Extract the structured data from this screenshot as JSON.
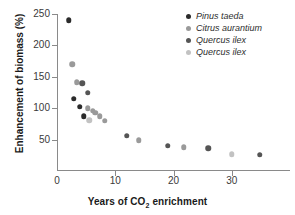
{
  "chart_data": {
    "type": "scatter",
    "title": "",
    "xlabel": "Years of CO2 enrichment",
    "xlabel_prefix": "Years of CO",
    "xlabel_sub": "2",
    "xlabel_suffix": " enrichment",
    "ylabel": "Enhancement of biomass (%)",
    "xlim": [
      0,
      40
    ],
    "ylim": [
      0,
      250
    ],
    "xticks": [
      0,
      10,
      20,
      30
    ],
    "yticks": [
      50,
      100,
      150,
      200,
      250
    ],
    "xtick_labels": [
      "0",
      "10",
      "20",
      "30"
    ],
    "ytick_labels": [
      "50",
      "100",
      "150",
      "200",
      "250"
    ],
    "grid": false,
    "legend_position": "top-right",
    "series": [
      {
        "name": "Pinus taeda",
        "color": "#2b2b2b",
        "points": [
          {
            "x": 2.0,
            "y": 240
          },
          {
            "x": 2.9,
            "y": 115
          },
          {
            "x": 3.9,
            "y": 102
          },
          {
            "x": 4.6,
            "y": 87
          }
        ]
      },
      {
        "name": "Citrus aurantium",
        "color": "#9a9a9a",
        "points": [
          {
            "x": 2.6,
            "y": 170
          },
          {
            "x": 3.4,
            "y": 141
          },
          {
            "x": 5.3,
            "y": 100
          },
          {
            "x": 6.1,
            "y": 96
          },
          {
            "x": 6.6,
            "y": 93
          },
          {
            "x": 7.3,
            "y": 87
          },
          {
            "x": 8.2,
            "y": 80
          },
          {
            "x": 14.0,
            "y": 49
          },
          {
            "x": 21.8,
            "y": 38
          }
        ]
      },
      {
        "name": "Quercus ilex",
        "color": "#555555",
        "points": [
          {
            "x": 4.3,
            "y": 140
          },
          {
            "x": 5.3,
            "y": 125
          },
          {
            "x": 12.0,
            "y": 56
          },
          {
            "x": 19.0,
            "y": 40
          },
          {
            "x": 26.0,
            "y": 36
          },
          {
            "x": 34.8,
            "y": 26
          }
        ]
      },
      {
        "name": "Quercus ilex",
        "color": "#c2c2c2",
        "points": [
          {
            "x": 5.5,
            "y": 81
          },
          {
            "x": 30.0,
            "y": 27
          }
        ]
      }
    ]
  },
  "legend": {
    "items": [
      {
        "label": "Pinus taeda",
        "color": "#2b2b2b"
      },
      {
        "label": "Citrus aurantium",
        "color": "#9a9a9a"
      },
      {
        "label": "Quercus ilex",
        "color": "#555555"
      },
      {
        "label": "Quercus ilex",
        "color": "#c2c2c2"
      }
    ]
  }
}
